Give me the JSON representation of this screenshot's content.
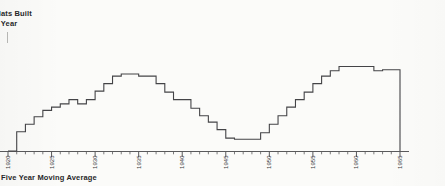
{
  "title": {
    "line1": "Flats Built",
    "line2": "h Year"
  },
  "caption": "Five Year Moving Average",
  "axis": {
    "tick_labels": [
      "1920",
      "1925",
      "1930",
      "1935",
      "1940",
      "1945",
      "1950",
      "1955",
      "1960",
      "1965"
    ]
  },
  "style": {
    "line_color": "#444447",
    "axis_color": "#5a5a5c",
    "background": "#fbfbf9",
    "text_color": "#28282a"
  },
  "chart_data": {
    "type": "line",
    "subtitle": "Five Year Moving Average",
    "xlabel": "",
    "ylabel": "Flats Built Each Year",
    "xlim": [
      1920,
      1965
    ],
    "ylim": [
      0,
      100
    ],
    "grid": false,
    "legend": "none",
    "step": "post",
    "x": [
      1920,
      1921,
      1922,
      1923,
      1924,
      1925,
      1926,
      1927,
      1928,
      1929,
      1930,
      1931,
      1932,
      1933,
      1934,
      1935,
      1936,
      1937,
      1938,
      1939,
      1940,
      1941,
      1942,
      1943,
      1944,
      1945,
      1946,
      1947,
      1948,
      1949,
      1950,
      1951,
      1952,
      1953,
      1954,
      1955,
      1956,
      1957,
      1958,
      1959,
      1960,
      1961,
      1962,
      1963,
      1964,
      1965
    ],
    "values": [
      0,
      18,
      25,
      32,
      38,
      41,
      44,
      48,
      44,
      48,
      56,
      63,
      70,
      72,
      72,
      70,
      70,
      63,
      55,
      48,
      48,
      40,
      33,
      27,
      20,
      12,
      11,
      11,
      11,
      17,
      25,
      33,
      41,
      48,
      55,
      63,
      70,
      75,
      79,
      79,
      79,
      79,
      75,
      76,
      76,
      0
    ],
    "series": [
      {
        "name": "Five Year Moving Average",
        "values": [
          0,
          18,
          25,
          32,
          38,
          41,
          44,
          48,
          44,
          48,
          56,
          63,
          70,
          72,
          72,
          70,
          70,
          63,
          55,
          48,
          48,
          40,
          33,
          27,
          20,
          12,
          11,
          11,
          11,
          17,
          25,
          33,
          41,
          48,
          55,
          63,
          70,
          75,
          79,
          79,
          79,
          79,
          75,
          76,
          76,
          0
        ]
      }
    ],
    "annotations": [
      "Rising trend through the 1920s",
      "Peak plateau in the early-to-mid 1930s",
      "Decline through the later 1930s into the war years",
      "Wartime trough around 1945-1948",
      "Strong post-war recovery to a high plateau in the late 1950s"
    ]
  }
}
